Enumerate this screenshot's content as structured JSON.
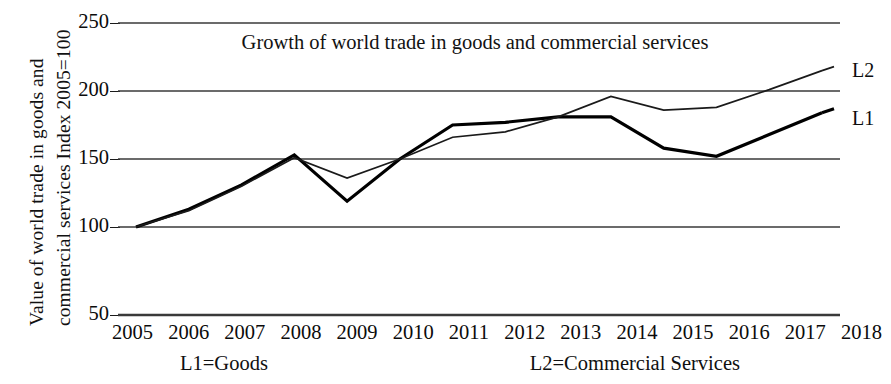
{
  "chart_data": {
    "type": "line",
    "title": "Growth of world trade in goods and commercial services",
    "xlabel": "",
    "ylabel": "Value of world trade in goods and commercial services Index 2005=100",
    "ylabel_line1": "Value of world trade in goods and",
    "ylabel_line2": "commercial services Index 2005=100",
    "categories": [
      "2005",
      "2006",
      "2007",
      "2008",
      "2009",
      "2010",
      "2011",
      "2012",
      "2013",
      "2014",
      "2015",
      "2016",
      "2017",
      "2018"
    ],
    "x": [
      2005,
      2006,
      2007,
      2008,
      2009,
      2010,
      2011,
      2012,
      2013,
      2014,
      2015,
      2016,
      2017,
      2018
    ],
    "series": [
      {
        "name": "L1",
        "label": "L1",
        "legend": "L1=Goods",
        "description": "Goods",
        "color": "#000000",
        "line_width": 3.2,
        "values": [
          100,
          113,
          131,
          153,
          119,
          150,
          175,
          177,
          181,
          181,
          158,
          152,
          168,
          184
        ]
      },
      {
        "name": "L2",
        "label": "L2",
        "legend": "L2=Commercial Services",
        "description": "Commercial Services",
        "color": "#1a1a1a",
        "line_width": 1.7,
        "values": [
          100,
          112,
          130,
          151,
          136,
          150,
          166,
          170,
          181,
          196,
          186,
          188,
          201,
          215
        ]
      }
    ],
    "yticks": [
      50,
      100,
      150,
      200,
      250
    ],
    "ytick_labels": [
      "50",
      "100",
      "150",
      "200",
      "250"
    ],
    "ylim": [
      50,
      250
    ],
    "grid": true,
    "grid_color": "#3a3a3a",
    "legend_position": "below-axis",
    "background": "#ffffff"
  },
  "series_end_labels": {
    "top": "L2",
    "bottom": "L1"
  },
  "legend": {
    "items": [
      "L1=Goods",
      "L2=Commercial Services"
    ]
  }
}
